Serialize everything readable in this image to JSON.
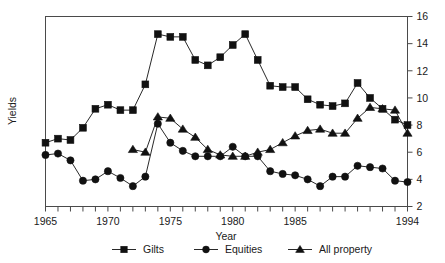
{
  "chart_data": {
    "type": "line",
    "title": "",
    "xlabel": "Year",
    "ylabel": "Yields",
    "xlim": [
      1965,
      1994
    ],
    "ylim": [
      2,
      16
    ],
    "ytick_side": "right",
    "yticks": [
      2,
      4,
      6,
      8,
      10,
      12,
      14,
      16
    ],
    "xticks_labeled": [
      1965,
      1970,
      1975,
      1980,
      1985,
      1994
    ],
    "xtick_step_minor": 1,
    "grid": false,
    "legend_position": "bottom",
    "x": [
      1965,
      1966,
      1967,
      1968,
      1969,
      1970,
      1971,
      1972,
      1973,
      1974,
      1975,
      1976,
      1977,
      1978,
      1979,
      1980,
      1981,
      1982,
      1983,
      1984,
      1985,
      1986,
      1987,
      1988,
      1989,
      1990,
      1991,
      1992,
      1993,
      1994
    ],
    "series": [
      {
        "name": "Gilts",
        "marker": "square",
        "color": "#111111",
        "values": [
          6.7,
          7.0,
          6.9,
          7.8,
          9.2,
          9.5,
          9.1,
          9.1,
          11.0,
          14.7,
          14.5,
          14.5,
          12.8,
          12.4,
          13.0,
          13.9,
          14.7,
          12.8,
          10.9,
          10.8,
          10.8,
          9.9,
          9.5,
          9.4,
          9.6,
          11.1,
          10.0,
          9.2,
          8.4,
          8.0
        ]
      },
      {
        "name": "Equities",
        "marker": "circle",
        "color": "#111111",
        "values": [
          5.8,
          5.9,
          5.4,
          3.9,
          4.0,
          4.6,
          4.1,
          3.5,
          4.2,
          8.1,
          6.7,
          6.1,
          5.7,
          5.7,
          5.7,
          6.4,
          5.7,
          5.7,
          4.6,
          4.4,
          4.3,
          4.0,
          3.5,
          4.2,
          4.2,
          5.0,
          4.9,
          4.8,
          3.9,
          3.8
        ]
      },
      {
        "name": "All property",
        "marker": "triangle",
        "color": "#111111",
        "values": [
          null,
          null,
          null,
          null,
          null,
          null,
          null,
          6.2,
          6.0,
          8.6,
          8.5,
          7.7,
          7.1,
          6.2,
          5.8,
          5.7,
          5.7,
          6.0,
          6.2,
          6.7,
          7.2,
          7.6,
          7.7,
          7.4,
          7.4,
          8.5,
          9.3,
          9.2,
          9.1,
          7.4
        ]
      }
    ]
  },
  "axis": {
    "ylabel": "Yields",
    "xlabel": "Year",
    "ytick_labels": [
      "2",
      "4",
      "6",
      "8",
      "10",
      "12",
      "14",
      "16"
    ],
    "xtick_labels": [
      "1965",
      "1970",
      "1975",
      "1980",
      "1985",
      "1994"
    ]
  },
  "legend": {
    "items": [
      {
        "label": "Gilts",
        "marker": "square"
      },
      {
        "label": "Equities",
        "marker": "circle"
      },
      {
        "label": "All property",
        "marker": "triangle"
      }
    ]
  }
}
